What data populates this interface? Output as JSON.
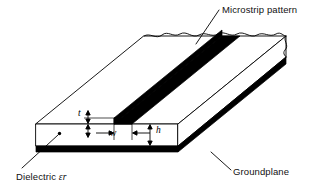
{
  "figure": {
    "kind": "isometric-line-drawing",
    "background_color": "#ffffff",
    "line_color": "#000000",
    "fill_color": "#ffffff",
    "metal_color": "#000000"
  },
  "callouts": {
    "microstrip": "Microstrip pattern",
    "groundplane": "Groundplane",
    "dielectric_text": "Dielectric ",
    "dielectric_symbol": "ε",
    "dielectric_subscript": "r"
  },
  "dimensions": {
    "thickness": "t",
    "width": "w",
    "height": "h"
  }
}
